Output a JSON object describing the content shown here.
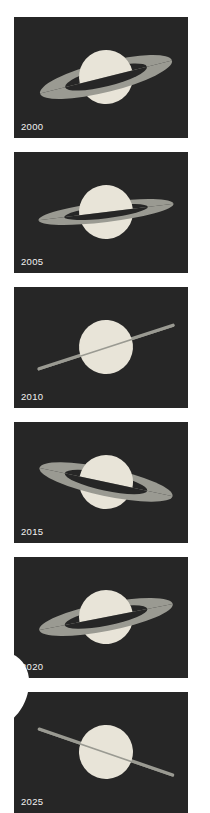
{
  "figure": {
    "background_color": "#ffffff",
    "panel_background": "#262626",
    "planet_color": "#e8e4d8",
    "ring_color": "#9a9a92",
    "ring_shadow_color": "#2b2b2b",
    "label_color": "#f2f2f2",
    "panel_count": 6,
    "layout": "vertical-stack"
  },
  "chart_data": {
    "type": "scatter",
    "xlabel": "",
    "ylabel": "",
    "categories": [
      "2000",
      "2005",
      "2010",
      "2015",
      "2020",
      "2025"
    ],
    "series": [
      {
        "name": "ring_tilt_degrees",
        "values": [
          -14,
          -7,
          1,
          12,
          -11,
          -17
        ]
      },
      {
        "name": "ring_openness",
        "values": [
          0.46,
          0.3,
          0.0,
          0.4,
          0.42,
          0.0
        ]
      }
    ]
  },
  "panels": [
    {
      "year": "2000",
      "id": "panel-2000",
      "ring_state": "open",
      "tilt_deg": -14,
      "ring_ry": 15,
      "ring_rx": 68,
      "planet_r": 27,
      "planet_cx": 92,
      "planet_cy": 60,
      "edge_on": false,
      "band_offset": 10
    },
    {
      "year": "2005",
      "id": "panel-2005",
      "ring_state": "open",
      "tilt_deg": -7,
      "ring_ry": 10,
      "ring_rx": 68,
      "planet_r": 27,
      "planet_cx": 92,
      "planet_cy": 60,
      "edge_on": false,
      "band_offset": 4
    },
    {
      "year": "2010",
      "id": "panel-2010",
      "ring_state": "edge-on",
      "tilt_deg": -18,
      "ring_ry": 0,
      "ring_rx": 72,
      "planet_r": 27,
      "planet_cx": 92,
      "planet_cy": 60,
      "edge_on": true,
      "band_offset": 0
    },
    {
      "year": "2015",
      "id": "panel-2015",
      "ring_state": "open",
      "tilt_deg": 12,
      "ring_ry": 14,
      "ring_rx": 68,
      "planet_r": 27,
      "planet_cx": 92,
      "planet_cy": 60,
      "edge_on": false,
      "band_offset": -9
    },
    {
      "year": "2020",
      "id": "panel-2020",
      "ring_state": "open",
      "tilt_deg": -11,
      "ring_ry": 14,
      "ring_rx": 68,
      "planet_r": 27,
      "planet_cx": 92,
      "planet_cy": 60,
      "edge_on": false,
      "band_offset": 7
    },
    {
      "year": "2025",
      "id": "panel-2025",
      "ring_state": "edge-on",
      "tilt_deg": 19,
      "ring_ry": 0,
      "ring_rx": 72,
      "planet_r": 27,
      "planet_cx": 92,
      "planet_cy": 60,
      "edge_on": true,
      "band_offset": 0
    }
  ],
  "overlay": {
    "name": "white-blob",
    "color": "#ffffff",
    "left": -18,
    "top": 652,
    "width": 52,
    "height": 72
  }
}
